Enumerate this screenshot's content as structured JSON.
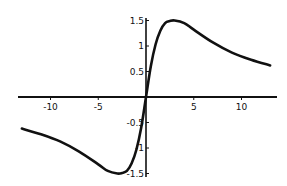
{
  "chart_data": {
    "type": "line",
    "title": "",
    "xlabel": "",
    "ylabel": "",
    "xlim": [
      -13,
      13
    ],
    "ylim": [
      -1.55,
      1.55
    ],
    "grid": false,
    "legend": null,
    "x_ticks": [
      -10,
      -5,
      5,
      10
    ],
    "x_tick_labels": [
      "-10",
      "-5",
      "5",
      "10"
    ],
    "y_ticks": [
      1.5,
      1,
      0.5,
      -0.5,
      -1,
      -1.5
    ],
    "y_tick_labels": [
      "1.5",
      "1",
      "0.5",
      "-0.5",
      "-1",
      "-1.5"
    ],
    "series": [
      {
        "name": "f(x)",
        "x": [
          -13,
          -11,
          -9,
          -7,
          -5,
          -4,
          -3,
          -2.5,
          -2,
          -1.5,
          -1,
          -0.5,
          0,
          0.5,
          1,
          1.5,
          2,
          2.5,
          3,
          4,
          5,
          7,
          9,
          11,
          13
        ],
        "y": [
          -0.62,
          -0.73,
          -0.87,
          -1.07,
          -1.32,
          -1.45,
          -1.5,
          -1.49,
          -1.45,
          -1.3,
          -1.03,
          -0.6,
          0,
          0.6,
          1.03,
          1.3,
          1.45,
          1.49,
          1.5,
          1.45,
          1.32,
          1.07,
          0.87,
          0.73,
          0.62
        ]
      }
    ],
    "color": "#111111"
  }
}
